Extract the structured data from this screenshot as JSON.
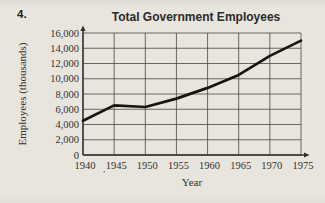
{
  "page": {
    "problem_number": "4.",
    "background_color": "#e8e5df"
  },
  "chart_data": {
    "type": "line",
    "title": "Total Government Employees",
    "xlabel": "Year",
    "ylabel": "Employees (thousands)",
    "x": [
      1940,
      1945,
      1950,
      1955,
      1960,
      1965,
      1970,
      1975
    ],
    "values": [
      4500,
      6500,
      6300,
      7400,
      8800,
      10500,
      13000,
      15000
    ],
    "series_name": "Total government employees (thousands)",
    "xtick_labels": [
      "1940",
      "1945",
      "1950",
      "1955",
      "1960",
      "1965",
      "1970",
      "1975"
    ],
    "ytick_labels": [
      "0",
      "2,000",
      "4,000",
      "6,000",
      "8,000",
      "10,000",
      "12,000",
      "14,000",
      "16,000"
    ],
    "xlim": [
      1940,
      1975
    ],
    "ylim": [
      0,
      16000
    ],
    "grid": true,
    "legend": false,
    "axis_arrows": true,
    "line_color": "#17150f",
    "grid_color": "#4b483f",
    "frame_color": "#302e26"
  },
  "artifacts": {
    "stray_comma": ","
  }
}
